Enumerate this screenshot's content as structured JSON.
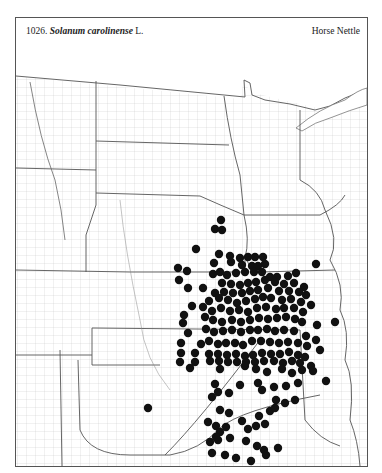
{
  "header": {
    "number": "1026.",
    "scientific_name": "Solanum carolinense",
    "authority": "L.",
    "common_name": "Horse Nettle"
  },
  "map": {
    "region": "Great Plains",
    "dot_color": "#111111",
    "line_color": "#777777",
    "dot_radius": 4.2,
    "dots": [
      [
        221,
        220
      ],
      [
        215,
        229
      ],
      [
        222,
        230
      ],
      [
        196,
        249
      ],
      [
        219,
        254
      ],
      [
        230,
        256
      ],
      [
        240,
        258
      ],
      [
        248,
        257
      ],
      [
        255,
        257
      ],
      [
        263,
        257
      ],
      [
        178,
        268
      ],
      [
        187,
        271
      ],
      [
        214,
        263
      ],
      [
        231,
        262
      ],
      [
        242,
        265
      ],
      [
        252,
        266
      ],
      [
        258,
        266
      ],
      [
        265,
        264
      ],
      [
        179,
        280
      ],
      [
        188,
        288
      ],
      [
        213,
        274
      ],
      [
        220,
        272
      ],
      [
        227,
        275
      ],
      [
        236,
        273
      ],
      [
        245,
        272
      ],
      [
        254,
        272
      ],
      [
        262,
        272
      ],
      [
        270,
        277
      ],
      [
        277,
        277
      ],
      [
        288,
        276
      ],
      [
        296,
        273
      ],
      [
        304,
        287
      ],
      [
        316,
        264
      ],
      [
        222,
        283
      ],
      [
        231,
        284
      ],
      [
        240,
        285
      ],
      [
        248,
        283
      ],
      [
        256,
        282
      ],
      [
        265,
        280
      ],
      [
        275,
        282
      ],
      [
        284,
        284
      ],
      [
        294,
        283
      ],
      [
        203,
        288
      ],
      [
        215,
        293
      ],
      [
        224,
        292
      ],
      [
        233,
        293
      ],
      [
        242,
        293
      ],
      [
        250,
        291
      ],
      [
        258,
        290
      ],
      [
        268,
        288
      ],
      [
        279,
        291
      ],
      [
        289,
        291
      ],
      [
        299,
        292
      ],
      [
        306,
        295
      ],
      [
        203,
        307
      ],
      [
        209,
        301
      ],
      [
        219,
        298
      ],
      [
        228,
        300
      ],
      [
        237,
        303
      ],
      [
        246,
        301
      ],
      [
        255,
        299
      ],
      [
        263,
        297
      ],
      [
        271,
        298
      ],
      [
        282,
        300
      ],
      [
        291,
        299
      ],
      [
        301,
        302
      ],
      [
        184,
        315
      ],
      [
        192,
        306
      ],
      [
        212,
        311
      ],
      [
        221,
        308
      ],
      [
        230,
        311
      ],
      [
        239,
        310
      ],
      [
        248,
        312
      ],
      [
        257,
        308
      ],
      [
        266,
        307
      ],
      [
        276,
        309
      ],
      [
        284,
        308
      ],
      [
        294,
        308
      ],
      [
        303,
        312
      ],
      [
        311,
        305
      ],
      [
        183,
        323
      ],
      [
        205,
        317
      ],
      [
        213,
        320
      ],
      [
        222,
        322
      ],
      [
        232,
        320
      ],
      [
        241,
        322
      ],
      [
        250,
        320
      ],
      [
        259,
        318
      ],
      [
        268,
        319
      ],
      [
        277,
        318
      ],
      [
        286,
        317
      ],
      [
        295,
        319
      ],
      [
        302,
        322
      ],
      [
        317,
        325
      ],
      [
        188,
        333
      ],
      [
        206,
        329
      ],
      [
        214,
        332
      ],
      [
        223,
        331
      ],
      [
        232,
        330
      ],
      [
        241,
        332
      ],
      [
        250,
        330
      ],
      [
        258,
        330
      ],
      [
        267,
        329
      ],
      [
        275,
        331
      ],
      [
        284,
        330
      ],
      [
        294,
        331
      ],
      [
        306,
        336
      ],
      [
        335,
        322
      ],
      [
        181,
        343
      ],
      [
        201,
        344
      ],
      [
        209,
        341
      ],
      [
        218,
        344
      ],
      [
        226,
        343
      ],
      [
        235,
        343
      ],
      [
        243,
        345
      ],
      [
        252,
        341
      ],
      [
        261,
        341
      ],
      [
        270,
        342
      ],
      [
        279,
        343
      ],
      [
        288,
        342
      ],
      [
        298,
        343
      ],
      [
        307,
        346
      ],
      [
        316,
        340
      ],
      [
        181,
        353
      ],
      [
        195,
        353
      ],
      [
        209,
        354
      ],
      [
        218,
        354
      ],
      [
        227,
        355
      ],
      [
        236,
        354
      ],
      [
        245,
        356
      ],
      [
        253,
        355
      ],
      [
        262,
        353
      ],
      [
        271,
        354
      ],
      [
        280,
        354
      ],
      [
        289,
        352
      ],
      [
        298,
        355
      ],
      [
        305,
        357
      ],
      [
        320,
        350
      ],
      [
        180,
        362
      ],
      [
        195,
        362
      ],
      [
        210,
        361
      ],
      [
        219,
        361
      ],
      [
        228,
        362
      ],
      [
        237,
        362
      ],
      [
        246,
        362
      ],
      [
        255,
        362
      ],
      [
        264,
        361
      ],
      [
        274,
        361
      ],
      [
        283,
        363
      ],
      [
        292,
        361
      ],
      [
        300,
        363
      ],
      [
        311,
        366
      ],
      [
        190,
        368
      ],
      [
        220,
        369
      ],
      [
        245,
        366
      ],
      [
        256,
        369
      ],
      [
        267,
        372
      ],
      [
        282,
        369
      ],
      [
        292,
        373
      ],
      [
        302,
        370
      ],
      [
        313,
        371
      ],
      [
        215,
        384
      ],
      [
        240,
        385
      ],
      [
        258,
        383
      ],
      [
        274,
        387
      ],
      [
        286,
        386
      ],
      [
        298,
        383
      ],
      [
        326,
        381
      ],
      [
        148,
        408
      ],
      [
        212,
        397
      ],
      [
        218,
        392
      ],
      [
        229,
        393
      ],
      [
        262,
        390
      ],
      [
        276,
        400
      ],
      [
        285,
        403
      ],
      [
        295,
        400
      ],
      [
        220,
        410
      ],
      [
        229,
        413
      ],
      [
        242,
        421
      ],
      [
        259,
        416
      ],
      [
        270,
        411
      ],
      [
        275,
        408
      ],
      [
        208,
        422
      ],
      [
        216,
        426
      ],
      [
        220,
        432
      ],
      [
        226,
        427
      ],
      [
        248,
        429
      ],
      [
        256,
        426
      ],
      [
        265,
        424
      ],
      [
        210,
        442
      ],
      [
        218,
        440
      ],
      [
        230,
        438
      ],
      [
        246,
        441
      ],
      [
        257,
        446
      ],
      [
        264,
        450
      ],
      [
        278,
        448
      ],
      [
        212,
        453
      ],
      [
        216,
        437
      ],
      [
        225,
        455
      ],
      [
        236,
        458
      ],
      [
        251,
        461
      ],
      [
        266,
        455
      ]
    ]
  }
}
